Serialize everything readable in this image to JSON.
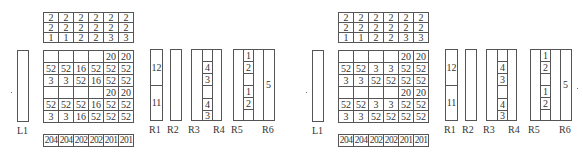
{
  "panels": [
    {
      "id": "left",
      "top_grid": [
        [
          "2",
          "2",
          "2",
          "2",
          "2",
          "2"
        ],
        [
          "2",
          "2",
          "2",
          "2",
          "2",
          "2"
        ],
        [
          "1",
          "1",
          "2",
          "2",
          "3",
          "3"
        ]
      ],
      "main_grid": [
        [
          "",
          "",
          "",
          "",
          "20",
          "20"
        ],
        [
          "52",
          "52",
          "16",
          "52",
          "52",
          "52"
        ],
        [
          "3",
          "3",
          "52",
          "16",
          "52",
          "52"
        ],
        [
          "",
          "",
          "",
          "",
          "20",
          "20"
        ],
        [
          "52",
          "52",
          "52",
          "16",
          "52",
          "52"
        ],
        [
          "3",
          "3",
          "16",
          "52",
          "52",
          "52"
        ]
      ],
      "bottom_row": [
        "204",
        "204",
        "202",
        "202",
        "201",
        "201"
      ],
      "labels": {
        "L1": "L1",
        "R1": "R1",
        "R2": "R2",
        "R3": "R3",
        "R4": "R4",
        "R5": "R5",
        "R6": "R6"
      },
      "r1_cells": [
        "12",
        "11"
      ],
      "r3r4_cells": [
        "",
        "4",
        "3",
        "",
        "4",
        "3"
      ],
      "r5_cells": [
        "1",
        "2",
        "",
        "1",
        "2",
        ""
      ],
      "r6_value": "5"
    },
    {
      "id": "right",
      "top_grid": [
        [
          "2",
          "2",
          "2",
          "2",
          "2",
          "2"
        ],
        [
          "2",
          "2",
          "2",
          "2",
          "2",
          "2"
        ],
        [
          "1",
          "1",
          "2",
          "2",
          "3",
          "3"
        ]
      ],
      "main_grid": [
        [
          "",
          "",
          "",
          "",
          "20",
          "20"
        ],
        [
          "52",
          "52",
          "3",
          "3",
          "52",
          "52"
        ],
        [
          "3",
          "3",
          "52",
          "52",
          "52",
          "52"
        ],
        [
          "",
          "",
          "",
          "",
          "20",
          "20"
        ],
        [
          "52",
          "52",
          "3",
          "3",
          "52",
          "52"
        ],
        [
          "3",
          "3",
          "52",
          "52",
          "52",
          "52"
        ]
      ],
      "bottom_row": [
        "204",
        "204",
        "202",
        "202",
        "201",
        "201"
      ],
      "labels": {
        "L1": "L1",
        "R1": "R1",
        "R2": "R2",
        "R3": "R3",
        "R4": "R4",
        "R5": "R5",
        "R6": "R6"
      },
      "r1_cells": [
        "12",
        "11"
      ],
      "r3r4_cells": [
        "",
        "4",
        "3",
        "",
        "4",
        "3"
      ],
      "r5_cells": [
        "1",
        "2",
        "",
        "1",
        "2",
        ""
      ],
      "r6_value": "5"
    }
  ]
}
